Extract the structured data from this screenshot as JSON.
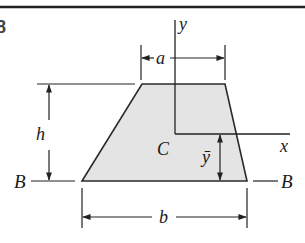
{
  "figure": {
    "number_fragment": "8",
    "colors": {
      "stroke": "#2a2a2a",
      "fill": "#e4e4e4",
      "rule": "#222222",
      "background": "#ffffff"
    },
    "shape": "trapezoid",
    "labels": {
      "y_axis": "y",
      "x_axis": "x",
      "centroid": "C",
      "top_width": "a",
      "bottom_width": "b",
      "height": "h",
      "centroid_offset": "ȳ",
      "base_left": "B",
      "base_right": "B"
    }
  }
}
